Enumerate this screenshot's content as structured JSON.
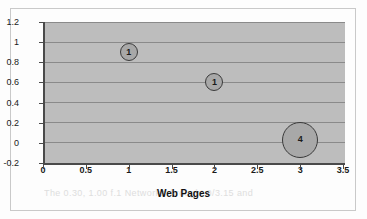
{
  "chart_data": {
    "type": "scatter",
    "subtype": "bubble",
    "title": "",
    "xlabel": "Web Pages",
    "ylabel": "",
    "xlim": [
      0,
      3.5
    ],
    "ylim": [
      -0.2,
      1.2
    ],
    "grid": true,
    "grid_axis": "y",
    "legend": "none",
    "plot_background_color": "#bdbdbd",
    "bubble_fill_color": "#a8a8a8",
    "bubble_border_color": "#3a3a3a",
    "gridline_color": "#8a8a8a",
    "axis_color": "#4a4a4a",
    "xticks": [
      "0",
      "0.5",
      "1",
      "1.5",
      "2",
      "2.5",
      "3",
      "3.5"
    ],
    "xtick_values": [
      0,
      0.5,
      1,
      1.5,
      2,
      2.5,
      3,
      3.5
    ],
    "yticks": [
      "1.2",
      "1",
      "0.8",
      "0.6",
      "0.4",
      "0.2",
      "0",
      "-0.2"
    ],
    "ytick_values": [
      1.2,
      1,
      0.8,
      0.6,
      0.4,
      0.2,
      0,
      -0.2
    ],
    "points": [
      {
        "x": 1,
        "y": 0.9,
        "size": 1,
        "label": "1"
      },
      {
        "x": 2,
        "y": 0.6,
        "size": 1,
        "label": "1"
      },
      {
        "x": 3,
        "y": 0.03,
        "size": 4,
        "label": "4"
      }
    ]
  },
  "artifacts": {
    "bleed_through_text": "The 0.30, 1.00 f.1 Networks' brought 0/3.15 and"
  }
}
